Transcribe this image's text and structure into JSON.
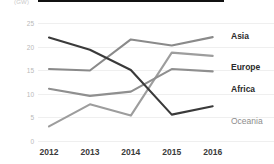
{
  "chart_data": {
    "type": "line",
    "title": "",
    "subtitle": "",
    "xlabel": "",
    "ylabel": "",
    "unit_label": "(GW)",
    "categories": [
      "2012",
      "2013",
      "2014",
      "2015",
      "2016"
    ],
    "x": [
      2012,
      2013,
      2014,
      2015,
      2016
    ],
    "ylim": [
      0,
      25
    ],
    "yticks": [
      0,
      5,
      10,
      15,
      20,
      25
    ],
    "ytick_labels": [
      "0",
      "5",
      "10",
      "15",
      "20",
      "25"
    ],
    "grid": true,
    "legend_position": "right-inline",
    "series": [
      {
        "name": "Asia",
        "values": [
          15.2,
          14.9,
          21.5,
          20.2,
          22.0
        ],
        "color": "#8a8a8a"
      },
      {
        "name": "Europe",
        "values": [
          3.0,
          7.7,
          5.3,
          18.7,
          18.0
        ],
        "color": "#9d9d9d"
      },
      {
        "name": "Africa",
        "values": [
          11.0,
          9.5,
          10.4,
          15.2,
          14.7
        ],
        "color": "#8f8f8f"
      },
      {
        "name": "Oceania",
        "values": [
          21.9,
          19.3,
          15.0,
          5.5,
          7.3
        ],
        "color": "#3a3a3a"
      }
    ],
    "labels": [
      {
        "text": "Asia",
        "series": "Asia",
        "style": "bold"
      },
      {
        "text": "Europe",
        "series": "Europe",
        "style": "bold"
      },
      {
        "text": "Africa",
        "series": "Africa",
        "style": "bold"
      },
      {
        "text": "Oceania",
        "series": "Oceania",
        "style": "muted"
      }
    ]
  },
  "axis": {
    "x_labels": [
      "2012",
      "2013",
      "2014",
      "2015",
      "2016"
    ],
    "y_labels": [
      "25",
      "20",
      "15",
      "10",
      "5",
      "0"
    ],
    "unit": "(GW)"
  }
}
